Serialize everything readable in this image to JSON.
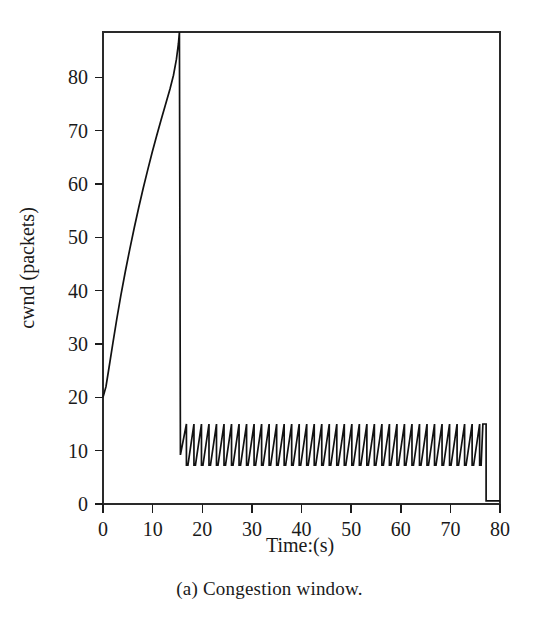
{
  "figure": {
    "caption": "(a) Congestion window.",
    "background_color": "#ffffff",
    "line_color": "#111111"
  },
  "chart_data": {
    "type": "line",
    "title": "",
    "subtitle": "",
    "xlabel": "Time:(s)",
    "ylabel": "cwnd (packets)",
    "xlim": [
      0,
      80
    ],
    "ylim": [
      0,
      88.5
    ],
    "xticks": [
      0,
      10,
      20,
      30,
      40,
      50,
      60,
      70,
      80
    ],
    "xtick_labels": [
      "0",
      "10",
      "20",
      "30",
      "40",
      "50",
      "60",
      "70",
      "80"
    ],
    "yticks": [
      0,
      10,
      20,
      30,
      40,
      50,
      60,
      70,
      80
    ],
    "ytick_labels": [
      "0",
      "10",
      "20",
      "30",
      "40",
      "50",
      "60",
      "70",
      "80"
    ],
    "grid": false,
    "legend": null,
    "legend_position": "none",
    "frame": "box",
    "annotations": [],
    "series": [
      {
        "name": "cwnd",
        "color": "#111111",
        "phases": [
          {
            "name": "slow-start-concave-growth",
            "description": "Concave rise from cwnd 20 at t=0 to clipped top ~88.5 at t=15.4",
            "t_start": 0,
            "t_end": 15.4,
            "y_start": 20,
            "y_end": 88.5
          },
          {
            "name": "loss-drop",
            "description": "Vertical drop from ~88.5 to ~9.2 at t=15.5",
            "t_start": 15.4,
            "t_end": 15.6,
            "y_start": 88.5,
            "y_end": 9.2
          },
          {
            "name": "congestion-avoidance-sawtooth",
            "description": "Repeating sawtooth oscillation between ~7.3 and ~15.0 for about 40 cycles",
            "t_start": 15.6,
            "t_end": 76.2,
            "y_min": 7.3,
            "y_max": 15.0,
            "cycles": 40
          },
          {
            "name": "final-plateau-and-drop",
            "description": "Holds at ~15 to t=77.2 then drops to ~0.6 and runs flat to t=80",
            "t_start": 76.2,
            "t_end": 80,
            "y_hold": 15.0,
            "y_end": 0.6,
            "drop_time": 77.2
          }
        ],
        "points": [
          [
            0.0,
            20.0
          ],
          [
            0.6,
            22.0
          ],
          [
            1.2,
            25.5
          ],
          [
            2.0,
            30.2
          ],
          [
            2.8,
            34.8
          ],
          [
            3.6,
            39.1
          ],
          [
            4.5,
            43.6
          ],
          [
            5.4,
            47.8
          ],
          [
            6.3,
            51.8
          ],
          [
            7.2,
            55.6
          ],
          [
            8.1,
            59.2
          ],
          [
            9.0,
            62.6
          ],
          [
            9.9,
            65.9
          ],
          [
            10.8,
            69.0
          ],
          [
            11.7,
            72.0
          ],
          [
            12.6,
            74.9
          ],
          [
            13.5,
            77.8
          ],
          [
            14.2,
            80.4
          ],
          [
            14.8,
            83.4
          ],
          [
            15.2,
            86.3
          ],
          [
            15.4,
            88.5
          ],
          [
            15.55,
            88.5
          ],
          [
            15.6,
            9.2
          ],
          [
            15.8,
            9.2
          ]
        ]
      }
    ]
  }
}
